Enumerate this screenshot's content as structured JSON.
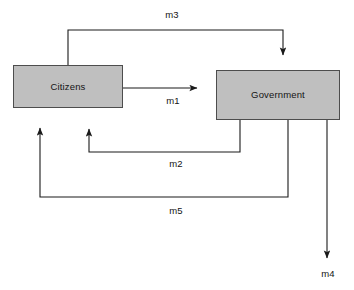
{
  "diagram": {
    "canvas": {
      "width": 354,
      "height": 290,
      "background": "#ffffff"
    },
    "style": {
      "node_fill": "#bfbfbf",
      "node_stroke": "#4d4d4d",
      "edge_stroke": "#1a1a1a",
      "text_color": "#141414"
    },
    "nodes": [
      {
        "id": "citizens",
        "label": "Citizens",
        "x": 13,
        "y": 65,
        "width": 110,
        "height": 43
      },
      {
        "id": "government",
        "label": "Government",
        "x": 216,
        "y": 70,
        "width": 124,
        "height": 50
      }
    ],
    "edges": [
      {
        "id": "m3",
        "label": "m3",
        "from": "citizens",
        "to": "government",
        "route": "top-loop",
        "description": "From top of Citizens up and over to top of Government"
      },
      {
        "id": "m1",
        "label": "m1",
        "from": "citizens",
        "to": "government",
        "route": "direct-right",
        "description": "Horizontal arrow from right side of Citizens toward Government"
      },
      {
        "id": "m2",
        "label": "m2",
        "from": "government",
        "to": "citizens",
        "route": "bottom-loop-inner",
        "description": "From bottom of Government down, left, and up to underside of Citizens"
      },
      {
        "id": "m5",
        "label": "m5",
        "from": "government",
        "to": "citizens",
        "route": "bottom-loop-outer",
        "description": "From bottom of Government down, far left, and up to underside of Citizens"
      },
      {
        "id": "m4",
        "label": "m4",
        "from": "government",
        "to": "external",
        "route": "down-out",
        "description": "From bottom of Government straight down off the diagram"
      }
    ]
  }
}
